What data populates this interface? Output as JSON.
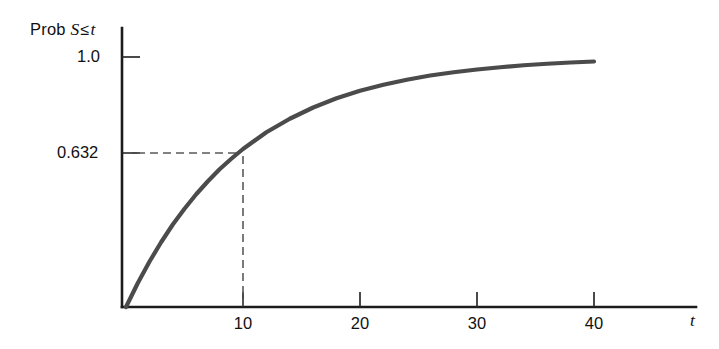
{
  "chart_data": {
    "type": "line",
    "title": "",
    "subtitle": "",
    "ylabel": "Prob S ≤ t",
    "ylabel_parts": {
      "prefix": "Prob",
      "variable": "S",
      "relation": "≤",
      "argument": "t"
    },
    "xlabel": "t",
    "xticks": [
      10,
      20,
      30,
      40
    ],
    "xtick_labels": [
      "10",
      "20",
      "30",
      "40"
    ],
    "yticks": [
      0.632,
      1.0
    ],
    "ytick_labels": [
      "0.632",
      "1.0"
    ],
    "xlim": [
      0,
      49
    ],
    "ylim": [
      0,
      1.12
    ],
    "grid": false,
    "legend": false,
    "curve": {
      "name": "Exponential CDF",
      "formula": "1 - exp(-t/10)",
      "color": "#4b4b4b",
      "x": [
        0,
        1,
        2,
        3,
        4,
        5,
        6,
        7,
        8,
        9,
        10,
        12,
        14,
        16,
        18,
        20,
        22,
        24,
        26,
        28,
        30,
        32,
        34,
        36,
        38,
        40
      ],
      "y": [
        0.0,
        0.095,
        0.181,
        0.259,
        0.33,
        0.393,
        0.451,
        0.503,
        0.551,
        0.593,
        0.632,
        0.699,
        0.753,
        0.798,
        0.835,
        0.865,
        0.889,
        0.909,
        0.926,
        0.939,
        0.95,
        0.959,
        0.967,
        0.973,
        0.978,
        0.982
      ]
    },
    "annotations": [
      {
        "name": "mean-lifetime-marker",
        "x": 10,
        "y": 0.632,
        "x_label": "10",
        "y_label": "0.632",
        "style": "dashed-guide",
        "color": "#5a5a5a"
      }
    ]
  },
  "axes": {
    "y_axis_label": "Prob S ≤ t",
    "x_axis_label": "t",
    "y_tick_top": "1.0",
    "y_tick_mid": "0.632",
    "x_tick_1": "10",
    "x_tick_2": "20",
    "x_tick_3": "30",
    "x_tick_4": "40"
  },
  "colors": {
    "curve": "#4b4b4b",
    "axis": "#1c1c1c",
    "guide": "#5a5a5a",
    "background": "#ffffff",
    "text": "#111111"
  }
}
